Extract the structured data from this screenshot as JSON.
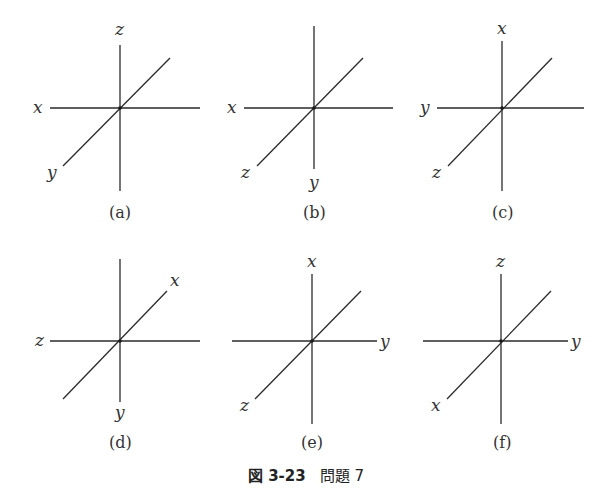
{
  "figure": {
    "caption_number": "図 3-23",
    "caption_title": "問題 7",
    "panels": [
      {
        "id": "a",
        "sub_caption": "(a)",
        "labels": {
          "up": "z",
          "left": "x",
          "down_left": "y",
          "right": "",
          "up_right": "",
          "down": ""
        }
      },
      {
        "id": "b",
        "sub_caption": "(b)",
        "labels": {
          "up": "",
          "left": "x",
          "down_left": "z",
          "right": "",
          "up_right": "",
          "down": "y"
        }
      },
      {
        "id": "c",
        "sub_caption": "(c)",
        "labels": {
          "up": "x",
          "left": "y",
          "down_left": "z",
          "right": "",
          "up_right": "",
          "down": ""
        }
      },
      {
        "id": "d",
        "sub_caption": "(d)",
        "labels": {
          "up": "",
          "left": "z",
          "down_left": "",
          "right": "",
          "up_right": "x",
          "down": "y"
        }
      },
      {
        "id": "e",
        "sub_caption": "(e)",
        "labels": {
          "up": "x",
          "left": "",
          "down_left": "z",
          "right": "y",
          "up_right": "",
          "down": ""
        }
      },
      {
        "id": "f",
        "sub_caption": "(f)",
        "labels": {
          "up": "z",
          "left": "",
          "down_left": "x",
          "right": "y",
          "up_right": "",
          "down": ""
        }
      }
    ]
  }
}
